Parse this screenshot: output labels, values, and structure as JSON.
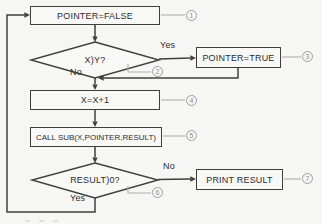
{
  "figure": {
    "background": "#f6f6f4",
    "line_color": "#3f3f3f",
    "annotation_color": "#9e9e9e"
  },
  "nodes": {
    "pointer_false": {
      "label": "POINTER=FALSE",
      "step": "1"
    },
    "x_gt_y": {
      "label": "X)Y?",
      "step": "2"
    },
    "pointer_true": {
      "label": "POINTER=TRUE",
      "step": "3"
    },
    "increment_x": {
      "label": "X=X+1",
      "step": "4"
    },
    "call_sub": {
      "label": "CALL SUB(X,POINTER,RESULT)",
      "step": "5"
    },
    "result_gt_0": {
      "label": "RESULT)0?",
      "step": "6"
    },
    "print_result": {
      "label": "PRINT RESULT",
      "step": "7"
    }
  },
  "branches": {
    "x_gt_y_yes": "Yes",
    "x_gt_y_no": "No",
    "result_no": "No",
    "result_yes": "Yes"
  }
}
